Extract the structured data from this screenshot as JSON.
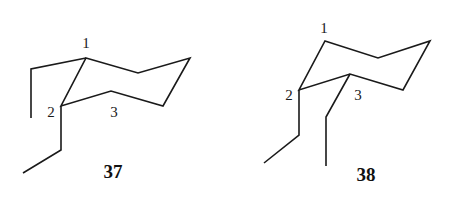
{
  "figure": {
    "type": "cyclohexane chair conformations",
    "structures": [
      {
        "id": "37",
        "compound_label": "37",
        "atom_labels": [
          {
            "text": "1",
            "x": 86,
            "y": 48
          },
          {
            "text": "2",
            "x": 51,
            "y": 117
          },
          {
            "text": "3",
            "x": 114,
            "y": 117
          }
        ],
        "ring_points": "86,58 138,73 190,58 163,106 111,91 61,106",
        "substituents": [
          {
            "on": "C1",
            "orientation": "axial-like",
            "points": "86,58 31,69 31,118"
          },
          {
            "on": "C2",
            "orientation": "axial-down",
            "points": "61,106 61,150 23,173"
          }
        ],
        "label_pos": {
          "x": 113,
          "y": 178
        }
      },
      {
        "id": "38",
        "compound_label": "38",
        "atom_labels": [
          {
            "text": "1",
            "x": 324,
            "y": 33
          },
          {
            "text": "2",
            "x": 289,
            "y": 100
          },
          {
            "text": "3",
            "x": 358,
            "y": 100
          }
        ],
        "ring_points": "325,41 378,58 430,41 403,90 350,74 299,90",
        "substituents": [
          {
            "on": "C2",
            "orientation": "axial-down",
            "points": "299,90 299,135 264,163"
          },
          {
            "on": "C3",
            "orientation": "equatorial-down",
            "points": "350,74 326,117 326,166"
          }
        ],
        "label_pos": {
          "x": 366,
          "y": 181
        }
      }
    ]
  }
}
